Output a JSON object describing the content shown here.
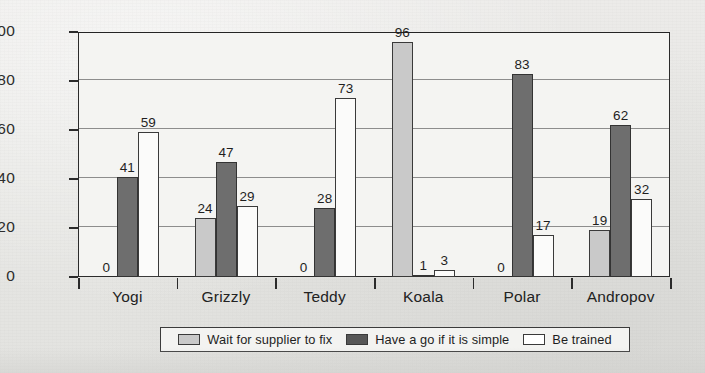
{
  "chart_data": {
    "type": "bar",
    "title": "",
    "subtitle": "",
    "xlabel": "",
    "ylabel": "",
    "ylim": [
      0,
      100
    ],
    "yticks": [
      0,
      20,
      40,
      60,
      80,
      100
    ],
    "grid": true,
    "legend_position": "bottom",
    "categories": [
      "Yogi",
      "Grizzly",
      "Teddy",
      "Koala",
      "Polar",
      "Andropov"
    ],
    "series": [
      {
        "name": "Wait for supplier to fix",
        "color": "#c9c9c9",
        "values": [
          0,
          24,
          0,
          96,
          0,
          19
        ]
      },
      {
        "name": "Have a go if it is simple",
        "color": "#6e6e6e",
        "values": [
          41,
          47,
          28,
          1,
          83,
          62
        ]
      },
      {
        "name": "Be trained",
        "color": "#ffffff",
        "values": [
          59,
          29,
          73,
          3,
          17,
          32
        ]
      }
    ]
  },
  "axis": {
    "y_tick_labels": [
      "0",
      "20",
      "40",
      "60",
      "80",
      "100"
    ]
  }
}
